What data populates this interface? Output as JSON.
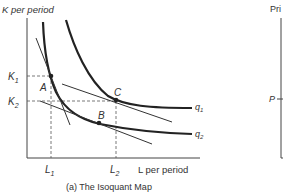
{
  "left_panel": {
    "y_axis_label": "K per period",
    "x_axis_label": "L  per period",
    "caption": "(a) The Isoquant Map",
    "y_ticks": [
      {
        "label": "K",
        "sub": "1"
      },
      {
        "label": "K",
        "sub": "2"
      }
    ],
    "x_ticks": [
      {
        "label": "L",
        "sub": "1"
      },
      {
        "label": "L",
        "sub": "2"
      }
    ],
    "points": [
      {
        "label": "A"
      },
      {
        "label": "B"
      },
      {
        "label": "C"
      }
    ],
    "isoquants": [
      {
        "label": "q",
        "sub": "1"
      },
      {
        "label": "q",
        "sub": "2"
      }
    ]
  },
  "right_panel": {
    "y_axis_label": "Pri",
    "price_tick": "P"
  },
  "colors": {
    "curve": "#222222",
    "line": "#333333",
    "dashed": "#555555"
  }
}
